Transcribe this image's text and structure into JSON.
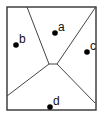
{
  "diagram": {
    "type": "voronoi",
    "frame": {
      "x": 7,
      "y": 7,
      "w": 89,
      "h": 103,
      "stroke": "#333333"
    },
    "edges": [
      {
        "x1": 27,
        "y1": 7,
        "x2": 49,
        "y2": 64
      },
      {
        "x1": 95,
        "y1": 8,
        "x2": 57,
        "y2": 64
      },
      {
        "x1": 49,
        "y1": 64,
        "x2": 57,
        "y2": 64
      },
      {
        "x1": 49,
        "y1": 64,
        "x2": 7,
        "y2": 96
      },
      {
        "x1": 57,
        "y1": 64,
        "x2": 95,
        "y2": 103
      }
    ],
    "sites": [
      {
        "label": "a",
        "x": 55,
        "y": 33
      },
      {
        "label": "b",
        "x": 16,
        "y": 45
      },
      {
        "label": "c",
        "x": 87,
        "y": 52
      },
      {
        "label": "d",
        "x": 50,
        "y": 107
      }
    ]
  }
}
